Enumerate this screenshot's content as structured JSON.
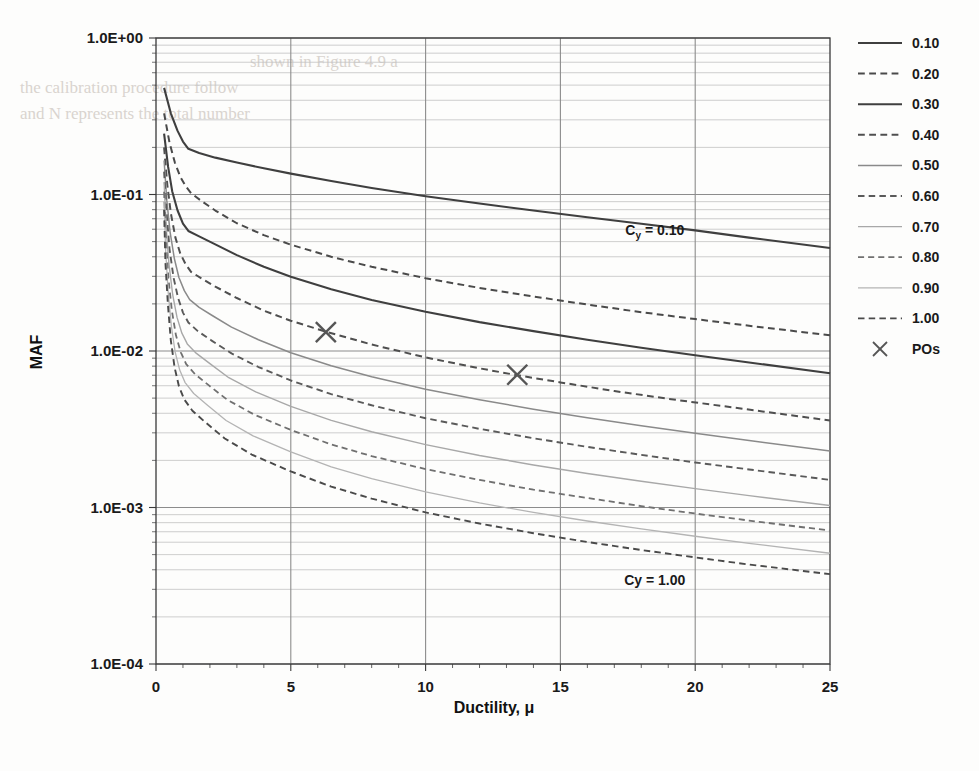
{
  "chart_data": {
    "type": "line",
    "title": "",
    "xlabel": "Ductility, μ",
    "ylabel": "MAF",
    "xlim": [
      0,
      25
    ],
    "ylim": [
      0.0001,
      1.0
    ],
    "yscale": "log",
    "xscale": "linear",
    "xticks": [
      0,
      5,
      10,
      15,
      20,
      25
    ],
    "xtick_labels": [
      "0",
      "5",
      "10",
      "15",
      "20",
      "25"
    ],
    "yticks": [
      1.0,
      0.1,
      0.01,
      0.001,
      0.0001
    ],
    "ytick_labels": [
      "1.0E+00",
      "1.0E-01",
      "1.0E-02",
      "1.0E-03",
      "1.0E-04"
    ],
    "grid": true,
    "grid_minor_y": true,
    "legend_position": "right",
    "legend_title": "",
    "annotations": [
      {
        "text": "Cy = 0.10",
        "sub": "y",
        "x": 18.5,
        "y": 0.055,
        "name": "cy-010-annotation"
      },
      {
        "text": "Cy = 1.00",
        "sub": "",
        "x": 18.5,
        "y": 0.00032,
        "name": "cy-100-annotation"
      }
    ],
    "series": [
      {
        "name": "0.10",
        "label": "0.10",
        "style": "solid",
        "color": "#3f3f3f",
        "width": 2.1,
        "points": [
          [
            0.3,
            0.48
          ],
          [
            0.55,
            0.33
          ],
          [
            0.8,
            0.255
          ],
          [
            1.0,
            0.218
          ],
          [
            1.2,
            0.196
          ],
          [
            1.6,
            0.184
          ],
          [
            2.2,
            0.172
          ],
          [
            3.0,
            0.16
          ],
          [
            4.0,
            0.147
          ],
          [
            5.0,
            0.136
          ],
          [
            6.5,
            0.122
          ],
          [
            8.0,
            0.11
          ],
          [
            10.0,
            0.0975
          ],
          [
            12.0,
            0.0875
          ],
          [
            14.0,
            0.079
          ],
          [
            16.0,
            0.0715
          ],
          [
            18.0,
            0.065
          ],
          [
            20.0,
            0.059
          ],
          [
            22.0,
            0.053
          ],
          [
            25.0,
            0.0455
          ]
        ]
      },
      {
        "name": "0.20",
        "label": "0.20",
        "style": "dashed",
        "color": "#4a4a4a",
        "width": 2.0,
        "points": [
          [
            0.3,
            0.33
          ],
          [
            0.5,
            0.215
          ],
          [
            0.7,
            0.16
          ],
          [
            0.9,
            0.13
          ],
          [
            1.1,
            0.113
          ],
          [
            1.3,
            0.102
          ],
          [
            1.7,
            0.0905
          ],
          [
            2.2,
            0.079
          ],
          [
            3.0,
            0.0655
          ],
          [
            4.0,
            0.055
          ],
          [
            5.0,
            0.0478
          ],
          [
            6.5,
            0.04
          ],
          [
            8.0,
            0.0345
          ],
          [
            10.0,
            0.0292
          ],
          [
            12.0,
            0.0253
          ],
          [
            14.0,
            0.0223
          ],
          [
            16.0,
            0.0198
          ],
          [
            18.0,
            0.0177
          ],
          [
            20.0,
            0.016
          ],
          [
            22.0,
            0.0145
          ],
          [
            25.0,
            0.0126
          ]
        ]
      },
      {
        "name": "0.30",
        "label": "0.30",
        "style": "solid",
        "color": "#3f3f3f",
        "width": 2.1,
        "points": [
          [
            0.3,
            0.245
          ],
          [
            0.45,
            0.15
          ],
          [
            0.6,
            0.105
          ],
          [
            0.8,
            0.079
          ],
          [
            1.0,
            0.0652
          ],
          [
            1.2,
            0.0585
          ],
          [
            1.6,
            0.054
          ],
          [
            2.2,
            0.048
          ],
          [
            3.0,
            0.041
          ],
          [
            4.0,
            0.0345
          ],
          [
            5.0,
            0.0298
          ],
          [
            6.5,
            0.0248
          ],
          [
            8.0,
            0.0212
          ],
          [
            10.0,
            0.0178
          ],
          [
            12.0,
            0.0153
          ],
          [
            14.0,
            0.0134
          ],
          [
            16.0,
            0.0118
          ],
          [
            18.0,
            0.0105
          ],
          [
            20.0,
            0.0094
          ],
          [
            22.0,
            0.00845
          ],
          [
            25.0,
            0.0072
          ]
        ]
      },
      {
        "name": "0.40",
        "label": "0.40",
        "style": "dashed",
        "color": "#4f4f4f",
        "width": 2.0,
        "points": [
          [
            0.3,
            0.2
          ],
          [
            0.42,
            0.115
          ],
          [
            0.55,
            0.076
          ],
          [
            0.72,
            0.053
          ],
          [
            0.9,
            0.042
          ],
          [
            1.1,
            0.0358
          ],
          [
            1.3,
            0.032
          ],
          [
            1.7,
            0.029
          ],
          [
            2.2,
            0.0258
          ],
          [
            3.0,
            0.0218
          ],
          [
            4.0,
            0.0181
          ],
          [
            5.0,
            0.0156
          ],
          [
            6.3,
            0.0133
          ],
          [
            8.0,
            0.011
          ],
          [
            10.0,
            0.0091
          ],
          [
            12.0,
            0.00775
          ],
          [
            13.4,
            0.007
          ],
          [
            15.0,
            0.0063
          ],
          [
            17.0,
            0.00555
          ],
          [
            19.0,
            0.00495
          ],
          [
            21.0,
            0.00445
          ],
          [
            23.0,
            0.004
          ],
          [
            25.0,
            0.0036
          ]
        ]
      },
      {
        "name": "0.50",
        "label": "0.50",
        "style": "solid",
        "color": "#8a8a8a",
        "width": 1.5,
        "points": [
          [
            0.3,
            0.165
          ],
          [
            0.4,
            0.092
          ],
          [
            0.52,
            0.058
          ],
          [
            0.68,
            0.039
          ],
          [
            0.85,
            0.0295
          ],
          [
            1.05,
            0.0243
          ],
          [
            1.25,
            0.0213
          ],
          [
            1.6,
            0.019
          ],
          [
            2.1,
            0.0168
          ],
          [
            2.8,
            0.0142
          ],
          [
            3.8,
            0.0118
          ],
          [
            5.0,
            0.00975
          ],
          [
            6.5,
            0.00805
          ],
          [
            8.0,
            0.00685
          ],
          [
            10.0,
            0.0057
          ],
          [
            12.0,
            0.00488
          ],
          [
            14.0,
            0.00425
          ],
          [
            16.0,
            0.00375
          ],
          [
            18.0,
            0.00333
          ],
          [
            20.0,
            0.00298
          ],
          [
            22.0,
            0.00268
          ],
          [
            25.0,
            0.0023
          ]
        ]
      },
      {
        "name": "0.60",
        "label": "0.60",
        "style": "dashed",
        "color": "#5a5a5a",
        "width": 1.9,
        "points": [
          [
            0.3,
            0.14
          ],
          [
            0.4,
            0.074
          ],
          [
            0.5,
            0.045
          ],
          [
            0.65,
            0.0295
          ],
          [
            0.82,
            0.0218
          ],
          [
            1.0,
            0.0176
          ],
          [
            1.2,
            0.0152
          ],
          [
            1.55,
            0.0134
          ],
          [
            2.05,
            0.0117
          ],
          [
            2.8,
            0.00965
          ],
          [
            3.8,
            0.0079
          ],
          [
            5.0,
            0.00648
          ],
          [
            6.5,
            0.0053
          ],
          [
            8.0,
            0.0045
          ],
          [
            10.0,
            0.00372
          ],
          [
            12.0,
            0.00318
          ],
          [
            14.0,
            0.00277
          ],
          [
            16.0,
            0.00244
          ],
          [
            18.0,
            0.00217
          ],
          [
            20.0,
            0.00194
          ],
          [
            22.0,
            0.00175
          ],
          [
            25.0,
            0.0015
          ]
        ]
      },
      {
        "name": "0.70",
        "label": "0.70",
        "style": "solid",
        "color": "#a8a8a8",
        "width": 1.4,
        "points": [
          [
            0.3,
            0.12
          ],
          [
            0.38,
            0.061
          ],
          [
            0.48,
            0.036
          ],
          [
            0.62,
            0.0228
          ],
          [
            0.78,
            0.0164
          ],
          [
            0.96,
            0.013
          ],
          [
            1.16,
            0.0111
          ],
          [
            1.5,
            0.00965
          ],
          [
            2.0,
            0.0083
          ],
          [
            2.7,
            0.00675
          ],
          [
            3.7,
            0.00548
          ],
          [
            5.0,
            0.00443
          ],
          [
            6.5,
            0.0036
          ],
          [
            8.0,
            0.00305
          ],
          [
            10.0,
            0.00252
          ],
          [
            12.0,
            0.00215
          ],
          [
            14.0,
            0.00187
          ],
          [
            16.0,
            0.00165
          ],
          [
            18.0,
            0.00147
          ],
          [
            20.0,
            0.00132
          ],
          [
            22.0,
            0.00119
          ],
          [
            25.0,
            0.00103
          ]
        ]
      },
      {
        "name": "0.80",
        "label": "0.80",
        "style": "dashed",
        "color": "#707070",
        "width": 1.8,
        "points": [
          [
            0.3,
            0.104
          ],
          [
            0.37,
            0.051
          ],
          [
            0.46,
            0.0292
          ],
          [
            0.59,
            0.018
          ],
          [
            0.74,
            0.0126
          ],
          [
            0.92,
            0.0098
          ],
          [
            1.12,
            0.00825
          ],
          [
            1.45,
            0.0071
          ],
          [
            1.95,
            0.00605
          ],
          [
            2.65,
            0.00487
          ],
          [
            3.65,
            0.00392
          ],
          [
            5.0,
            0.00313
          ],
          [
            6.5,
            0.00253
          ],
          [
            8.0,
            0.00213
          ],
          [
            10.0,
            0.00176
          ],
          [
            12.0,
            0.0015
          ],
          [
            14.0,
            0.0013
          ],
          [
            16.0,
            0.00115
          ],
          [
            18.0,
            0.00102
          ],
          [
            20.0,
            0.000915
          ],
          [
            22.0,
            0.000825
          ],
          [
            25.0,
            0.000712
          ]
        ]
      },
      {
        "name": "0.90",
        "label": "0.90",
        "style": "solid",
        "color": "#b4b4b4",
        "width": 1.3,
        "points": [
          [
            0.3,
            0.091
          ],
          [
            0.36,
            0.043
          ],
          [
            0.45,
            0.024
          ],
          [
            0.57,
            0.0144
          ],
          [
            0.71,
            0.00985
          ],
          [
            0.88,
            0.00755
          ],
          [
            1.08,
            0.00628
          ],
          [
            1.4,
            0.00535
          ],
          [
            1.9,
            0.00452
          ],
          [
            2.6,
            0.0036
          ],
          [
            3.6,
            0.00287
          ],
          [
            5.0,
            0.00227
          ],
          [
            6.5,
            0.00182
          ],
          [
            8.0,
            0.00153
          ],
          [
            10.0,
            0.00126
          ],
          [
            12.0,
            0.00107
          ],
          [
            14.0,
            0.00093
          ],
          [
            16.0,
            0.00082
          ],
          [
            18.0,
            0.00073
          ],
          [
            20.0,
            0.000655
          ],
          [
            22.0,
            0.00059
          ],
          [
            25.0,
            0.00051
          ]
        ]
      },
      {
        "name": "1.00",
        "label": "1.00",
        "style": "dashed",
        "color": "#4a4a4a",
        "width": 1.9,
        "points": [
          [
            0.3,
            0.08
          ],
          [
            0.35,
            0.0366
          ],
          [
            0.44,
            0.02
          ],
          [
            0.55,
            0.0117
          ],
          [
            0.69,
            0.00785
          ],
          [
            0.85,
            0.00595
          ],
          [
            1.05,
            0.0049
          ],
          [
            1.35,
            0.00415
          ],
          [
            1.85,
            0.00348
          ],
          [
            2.55,
            0.00276
          ],
          [
            3.55,
            0.00218
          ],
          [
            5.0,
            0.0017
          ],
          [
            6.5,
            0.00136
          ],
          [
            8.0,
            0.00114
          ],
          [
            10.0,
            0.00093
          ],
          [
            12.0,
            0.00079
          ],
          [
            14.0,
            0.000685
          ],
          [
            16.0,
            0.000602
          ],
          [
            18.0,
            0.000535
          ],
          [
            20.0,
            0.00048
          ],
          [
            22.0,
            0.000432
          ],
          [
            25.0,
            0.000375
          ]
        ]
      }
    ],
    "markers": {
      "name": "POs",
      "label": "POs",
      "symbol": "x",
      "color": "#555555",
      "points": [
        [
          6.3,
          0.0132
        ],
        [
          13.4,
          0.00705
        ]
      ]
    }
  },
  "legend": {
    "entries": [
      {
        "label": "0.10",
        "style": "solid",
        "color": "#3f3f3f",
        "width": 2.1
      },
      {
        "label": "0.20",
        "style": "dashed",
        "color": "#4a4a4a",
        "width": 2.0
      },
      {
        "label": "0.30",
        "style": "solid",
        "color": "#3f3f3f",
        "width": 2.1
      },
      {
        "label": "0.40",
        "style": "dashed",
        "color": "#4f4f4f",
        "width": 2.0
      },
      {
        "label": "0.50",
        "style": "solid",
        "color": "#8a8a8a",
        "width": 1.5
      },
      {
        "label": "0.60",
        "style": "dashed",
        "color": "#5a5a5a",
        "width": 1.9
      },
      {
        "label": "0.70",
        "style": "solid",
        "color": "#a8a8a8",
        "width": 1.4
      },
      {
        "label": "0.80",
        "style": "dashed",
        "color": "#707070",
        "width": 1.8
      },
      {
        "label": "0.90",
        "style": "solid",
        "color": "#b4b4b4",
        "width": 1.3
      },
      {
        "label": "1.00",
        "style": "dashed",
        "color": "#4a4a4a",
        "width": 1.9
      },
      {
        "label": "POs",
        "style": "marker",
        "color": "#555555",
        "width": 1.5
      }
    ]
  },
  "colors": {
    "axis": "#3a3a3a",
    "major_grid": "#8c8c8c",
    "minor_grid": "#c2c2c2",
    "text": "#1a1a1a",
    "page_background": "#fdfdfc",
    "bleed_text": "#d9d4cf"
  },
  "background_bleed": [
    {
      "text": "shown in Figure 4.9 a",
      "x": 250,
      "y": 52
    },
    {
      "text": "the calibration procedure follow",
      "x": 20,
      "y": 78
    },
    {
      "text": "and N represents the total number",
      "x": 20,
      "y": 104
    }
  ]
}
